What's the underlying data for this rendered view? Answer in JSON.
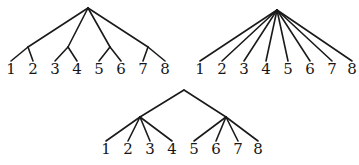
{
  "figure": {
    "background_color": "#ffffff",
    "line_color": "#1a1a1a",
    "label_color": "#161616",
    "width": 359,
    "height": 165
  },
  "trees": [
    {
      "id": "tree-balanced-pairs",
      "name": "Tree with four internal nodes of two leaves each",
      "position": "top-left",
      "root": {
        "x": 88,
        "y": 8
      },
      "internal_nodes": [
        {
          "id": "n1",
          "x": 28,
          "y": 47
        },
        {
          "id": "n2",
          "x": 68,
          "y": 47
        },
        {
          "id": "n3",
          "x": 110,
          "y": 47
        },
        {
          "id": "n4",
          "x": 148,
          "y": 47
        }
      ],
      "leaves": [
        {
          "label": "1",
          "x": 11,
          "y": 74,
          "parent": "n1"
        },
        {
          "label": "2",
          "x": 33,
          "y": 74,
          "parent": "n1"
        },
        {
          "label": "3",
          "x": 55,
          "y": 74,
          "parent": "n2"
        },
        {
          "label": "4",
          "x": 77,
          "y": 74,
          "parent": "n2"
        },
        {
          "label": "5",
          "x": 99,
          "y": 74,
          "parent": "n3"
        },
        {
          "label": "6",
          "x": 121,
          "y": 74,
          "parent": "n3"
        },
        {
          "label": "7",
          "x": 143,
          "y": 74,
          "parent": "n4"
        },
        {
          "label": "8",
          "x": 165,
          "y": 74,
          "parent": "n4"
        }
      ]
    },
    {
      "id": "tree-star",
      "name": "Star tree with eight leaves attached to the root",
      "position": "top-right",
      "root": {
        "x": 277,
        "y": 10
      },
      "internal_nodes": [],
      "leaves": [
        {
          "label": "1",
          "x": 200,
          "y": 74,
          "parent": "root"
        },
        {
          "label": "2",
          "x": 222,
          "y": 74,
          "parent": "root"
        },
        {
          "label": "3",
          "x": 244,
          "y": 74,
          "parent": "root"
        },
        {
          "label": "4",
          "x": 266,
          "y": 74,
          "parent": "root"
        },
        {
          "label": "5",
          "x": 288,
          "y": 74,
          "parent": "root"
        },
        {
          "label": "6",
          "x": 310,
          "y": 74,
          "parent": "root"
        },
        {
          "label": "7",
          "x": 332,
          "y": 74,
          "parent": "root"
        },
        {
          "label": "8",
          "x": 352,
          "y": 74,
          "parent": "root"
        }
      ]
    },
    {
      "id": "tree-two-clusters",
      "name": "Tree with two internal nodes of four leaves each",
      "position": "bottom-center",
      "root": {
        "x": 184,
        "y": 90
      },
      "internal_nodes": [
        {
          "id": "m1",
          "x": 140,
          "y": 117
        },
        {
          "id": "m2",
          "x": 226,
          "y": 117
        }
      ],
      "leaves": [
        {
          "label": "1",
          "x": 106,
          "y": 154,
          "parent": "m1"
        },
        {
          "label": "2",
          "x": 128,
          "y": 154,
          "parent": "m1"
        },
        {
          "label": "3",
          "x": 150,
          "y": 154,
          "parent": "m1"
        },
        {
          "label": "4",
          "x": 172,
          "y": 154,
          "parent": "m1"
        },
        {
          "label": "5",
          "x": 194,
          "y": 154,
          "parent": "m2"
        },
        {
          "label": "6",
          "x": 216,
          "y": 154,
          "parent": "m2"
        },
        {
          "label": "7",
          "x": 238,
          "y": 154,
          "parent": "m2"
        },
        {
          "label": "8",
          "x": 258,
          "y": 154,
          "parent": "m2"
        }
      ]
    }
  ]
}
